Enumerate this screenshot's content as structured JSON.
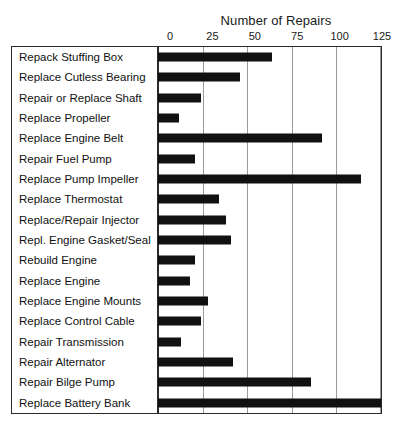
{
  "chart_data": {
    "type": "bar",
    "orientation": "horizontal",
    "title": "Number of Repairs",
    "xlabel": "",
    "ylabel": "",
    "xlim": [
      0,
      125
    ],
    "xticks": [
      0,
      25,
      50,
      75,
      100,
      125
    ],
    "xtick_labels": [
      "0",
      "25",
      "50",
      "75",
      "100",
      "125"
    ],
    "grid": "vertical",
    "legend": "none",
    "bar_color": "#111111",
    "categories": [
      "Repack Stuffing Box",
      "Replace Cutless Bearing",
      "Repair or Replace Shaft",
      "Replace Propeller",
      "Replace Engine Belt",
      "Repair Fuel Pump",
      "Replace Pump Impeller",
      "Replace Thermostat",
      "Replace/Repair Injector",
      "Repl. Engine Gasket/Seal",
      "Rebuild Engine",
      "Replace Engine",
      "Replace Engine Mounts",
      "Replace Control Cable",
      "Repair Transmission",
      "Repair Alternator",
      "Repair Bilge Pump",
      "Replace Battery Bank"
    ],
    "values": [
      64,
      46,
      24,
      12,
      92,
      21,
      114,
      34,
      38,
      41,
      21,
      18,
      28,
      24,
      13,
      42,
      86,
      125
    ]
  }
}
